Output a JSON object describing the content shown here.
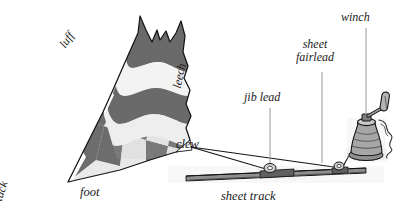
{
  "diagram": {
    "style": "pencil-shaded line drawing",
    "background_color": "#ffffff",
    "ink_color": "#1a1a1a",
    "shade_dark": "#6a6a6a",
    "shade_mid": "#8d8d8d",
    "shade_light": "#dedede",
    "shade_pale": "#f0f0f0"
  },
  "labels": {
    "luff": {
      "text": "luff",
      "rotation": -55
    },
    "leech": {
      "text": "leech",
      "rotation": -78
    },
    "tack": {
      "text": "tack",
      "rotation": -72
    },
    "foot": {
      "text": "foot",
      "rotation": 0
    },
    "clew": {
      "text": "clew",
      "rotation": 0
    },
    "jib_lead": {
      "text": "jib lead",
      "rotation": 0
    },
    "sheet_fairlead": {
      "text": "sheet\nfairlead",
      "rotation": 0
    },
    "winch": {
      "text": "winch",
      "rotation": 0
    },
    "sheet_track": {
      "text": "sheet track",
      "rotation": 0
    }
  },
  "parts": [
    {
      "name": "sail",
      "label": "jib sail"
    },
    {
      "name": "sheet-track",
      "label": "sheet track"
    },
    {
      "name": "jib-lead-car",
      "label": "jib lead"
    },
    {
      "name": "sheet-fairlead",
      "label": "sheet fairlead"
    },
    {
      "name": "winch",
      "label": "winch"
    },
    {
      "name": "sheet-line",
      "label": "sheet"
    },
    {
      "name": "rope-coil",
      "label": "rope tail"
    }
  ]
}
